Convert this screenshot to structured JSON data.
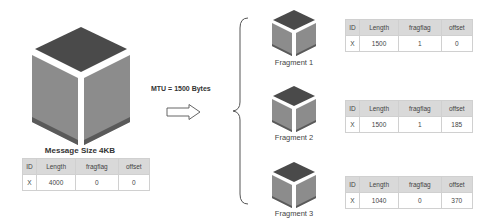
{
  "original": {
    "caption": "Message Size 4KB",
    "table": {
      "headers": [
        "ID",
        "Length",
        "fragflag",
        "offset"
      ],
      "row": [
        "X",
        "4000",
        "0",
        "0"
      ]
    }
  },
  "mtu": {
    "label": "MTU = 1500 Bytes"
  },
  "fragments": [
    {
      "caption": "Fragment 1",
      "table": {
        "headers": [
          "ID",
          "Length",
          "fragflag",
          "offset"
        ],
        "row": [
          "X",
          "1500",
          "1",
          "0"
        ]
      }
    },
    {
      "caption": "Fragment 2",
      "table": {
        "headers": [
          "ID",
          "Length",
          "fragflag",
          "offset"
        ],
        "row": [
          "X",
          "1500",
          "1",
          "185"
        ]
      }
    },
    {
      "caption": "Fragment 3",
      "table": {
        "headers": [
          "ID",
          "Length",
          "fragflag",
          "offset"
        ],
        "row": [
          "X",
          "1040",
          "0",
          "370"
        ]
      }
    }
  ],
  "colors": {
    "cube_top": "#4a4a4a",
    "cube_side": "#8c8c8c",
    "cube_base": "#5a5a5a",
    "table_header": "#d9d9d9",
    "table_border": "#d0d0d0"
  }
}
